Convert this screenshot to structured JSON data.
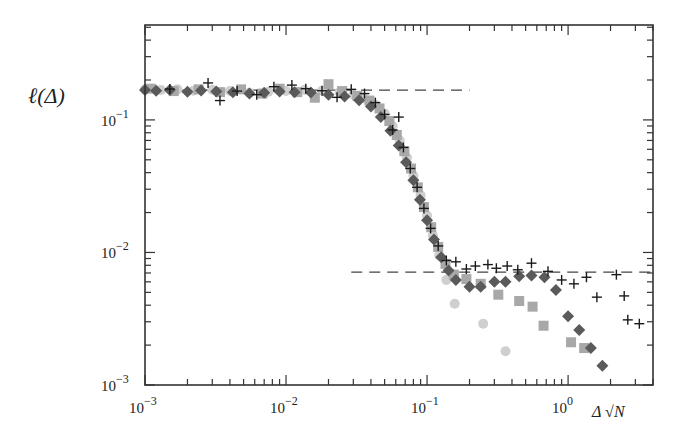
{
  "chart_data": {
    "type": "scatter",
    "title": "",
    "xlabel": "Δ √N",
    "ylabel": "ℓ(Δ)",
    "xscale": "log",
    "yscale": "log",
    "xlim": [
      0.001,
      4.0
    ],
    "ylim": [
      0.001,
      0.52
    ],
    "grid": false,
    "legend": null,
    "x_ticks": [
      {
        "value": 0.001,
        "label": "10",
        "exp": "−3"
      },
      {
        "value": 0.01,
        "label": "10",
        "exp": "−2"
      },
      {
        "value": 0.1,
        "label": "10",
        "exp": "−1"
      },
      {
        "value": 1,
        "label": "10",
        "exp": "0"
      }
    ],
    "y_ticks": [
      {
        "value": 0.001,
        "label": "10",
        "exp": "−3"
      },
      {
        "value": 0.01,
        "label": "10",
        "exp": "−2"
      },
      {
        "value": 0.1,
        "label": "10",
        "exp": "−1"
      }
    ],
    "reference_lines": [
      {
        "name": "upper-plateau",
        "style": "dashed",
        "y": 0.168,
        "x_from": 0.001,
        "x_to": 0.2
      },
      {
        "name": "lower-plateau",
        "style": "dashed",
        "y": 0.0071,
        "x_from": 0.029,
        "x_to": 4.0
      }
    ],
    "series": [
      {
        "name": "circles",
        "marker": "circle",
        "color": "#cfcfcf",
        "points": [
          [
            0.001,
            0.17
          ],
          [
            0.0013,
            0.168
          ],
          [
            0.0017,
            0.17
          ],
          [
            0.0022,
            0.166
          ],
          [
            0.003,
            0.169
          ],
          [
            0.004,
            0.165
          ],
          [
            0.0055,
            0.16
          ],
          [
            0.0075,
            0.163
          ],
          [
            0.01,
            0.165
          ],
          [
            0.0135,
            0.168
          ],
          [
            0.018,
            0.166
          ],
          [
            0.024,
            0.162
          ],
          [
            0.03,
            0.155
          ],
          [
            0.036,
            0.145
          ],
          [
            0.043,
            0.13
          ],
          [
            0.05,
            0.112
          ],
          [
            0.057,
            0.09
          ],
          [
            0.064,
            0.07
          ],
          [
            0.072,
            0.052
          ],
          [
            0.08,
            0.038
          ],
          [
            0.09,
            0.027
          ],
          [
            0.1,
            0.019
          ],
          [
            0.11,
            0.0135
          ],
          [
            0.122,
            0.0095
          ],
          [
            0.137,
            0.0062
          ],
          [
            0.157,
            0.0041
          ],
          [
            0.25,
            0.0029
          ],
          [
            0.36,
            0.0018
          ]
        ]
      },
      {
        "name": "squares",
        "marker": "square",
        "color": "#a8a8a8",
        "points": [
          [
            0.0011,
            0.172
          ],
          [
            0.0016,
            0.165
          ],
          [
            0.0024,
            0.17
          ],
          [
            0.0034,
            0.162
          ],
          [
            0.0048,
            0.17
          ],
          [
            0.0068,
            0.158
          ],
          [
            0.009,
            0.172
          ],
          [
            0.012,
            0.162
          ],
          [
            0.016,
            0.147
          ],
          [
            0.02,
            0.186
          ],
          [
            0.025,
            0.165
          ],
          [
            0.032,
            0.152
          ],
          [
            0.039,
            0.14
          ],
          [
            0.046,
            0.122
          ],
          [
            0.054,
            0.098
          ],
          [
            0.061,
            0.077
          ],
          [
            0.069,
            0.058
          ],
          [
            0.077,
            0.043
          ],
          [
            0.086,
            0.031
          ],
          [
            0.095,
            0.022
          ],
          [
            0.107,
            0.0155
          ],
          [
            0.12,
            0.011
          ],
          [
            0.135,
            0.0082
          ],
          [
            0.155,
            0.0068
          ],
          [
            0.19,
            0.0063
          ],
          [
            0.24,
            0.0058
          ],
          [
            0.32,
            0.0048
          ],
          [
            0.45,
            0.0043
          ],
          [
            0.56,
            0.0039
          ],
          [
            0.67,
            0.0028
          ],
          [
            1.05,
            0.0021
          ],
          [
            1.3,
            0.0019
          ]
        ]
      },
      {
        "name": "diamonds",
        "marker": "diamond",
        "color": "#5a5a5a",
        "points": [
          [
            0.001,
            0.168
          ],
          [
            0.0012,
            0.166
          ],
          [
            0.0015,
            0.168
          ],
          [
            0.002,
            0.163
          ],
          [
            0.0025,
            0.167
          ],
          [
            0.0032,
            0.164
          ],
          [
            0.0042,
            0.162
          ],
          [
            0.0055,
            0.158
          ],
          [
            0.007,
            0.16
          ],
          [
            0.009,
            0.164
          ],
          [
            0.0115,
            0.162
          ],
          [
            0.015,
            0.161
          ],
          [
            0.02,
            0.155
          ],
          [
            0.026,
            0.15
          ],
          [
            0.033,
            0.141
          ],
          [
            0.04,
            0.126
          ],
          [
            0.047,
            0.105
          ],
          [
            0.055,
            0.083
          ],
          [
            0.063,
            0.064
          ],
          [
            0.071,
            0.048
          ],
          [
            0.08,
            0.035
          ],
          [
            0.089,
            0.025
          ],
          [
            0.1,
            0.0175
          ],
          [
            0.112,
            0.0125
          ],
          [
            0.126,
            0.0092
          ],
          [
            0.142,
            0.0073
          ],
          [
            0.16,
            0.0062
          ],
          [
            0.2,
            0.0055
          ],
          [
            0.24,
            0.0055
          ],
          [
            0.3,
            0.006
          ],
          [
            0.36,
            0.006
          ],
          [
            0.45,
            0.0066
          ],
          [
            0.55,
            0.0067
          ],
          [
            0.68,
            0.0065
          ],
          [
            0.82,
            0.0052
          ],
          [
            1.0,
            0.0033
          ],
          [
            1.2,
            0.0026
          ],
          [
            1.45,
            0.0019
          ],
          [
            1.75,
            0.0014
          ]
        ]
      },
      {
        "name": "plus",
        "marker": "plus",
        "color": "#1a1a1a",
        "points": [
          [
            0.0015,
            0.171
          ],
          [
            0.0028,
            0.19
          ],
          [
            0.0034,
            0.14
          ],
          [
            0.0045,
            0.165
          ],
          [
            0.0062,
            0.155
          ],
          [
            0.0082,
            0.178
          ],
          [
            0.011,
            0.183
          ],
          [
            0.0138,
            0.172
          ],
          [
            0.018,
            0.166
          ],
          [
            0.023,
            0.148
          ],
          [
            0.029,
            0.17
          ],
          [
            0.036,
            0.158
          ],
          [
            0.043,
            0.135
          ],
          [
            0.05,
            0.11
          ],
          [
            0.057,
            0.084
          ],
          [
            0.063,
            0.105
          ],
          [
            0.068,
            0.062
          ],
          [
            0.076,
            0.043
          ],
          [
            0.085,
            0.031
          ],
          [
            0.095,
            0.0215
          ],
          [
            0.106,
            0.0152
          ],
          [
            0.12,
            0.0112
          ],
          [
            0.137,
            0.0087
          ],
          [
            0.16,
            0.0085
          ],
          [
            0.19,
            0.0075
          ],
          [
            0.22,
            0.0079
          ],
          [
            0.27,
            0.0081
          ],
          [
            0.31,
            0.0076
          ],
          [
            0.37,
            0.0079
          ],
          [
            0.44,
            0.0074
          ],
          [
            0.55,
            0.0083
          ],
          [
            0.72,
            0.0072
          ],
          [
            0.9,
            0.0062
          ],
          [
            1.1,
            0.0058
          ],
          [
            1.35,
            0.0065
          ],
          [
            1.6,
            0.0046
          ],
          [
            2.2,
            0.0068
          ],
          [
            2.5,
            0.0047
          ],
          [
            2.65,
            0.0031
          ],
          [
            3.2,
            0.0029
          ]
        ]
      }
    ]
  }
}
